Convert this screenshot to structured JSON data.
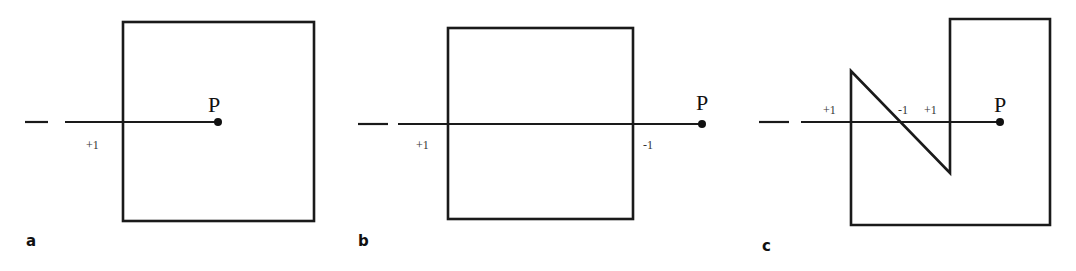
{
  "figure": {
    "hatch_color": "#8a8a8a",
    "stroke_color": "#1a1a1a",
    "panels": [
      {
        "id": "a",
        "panel_label": "a",
        "point_label": "P",
        "crossings": [
          "+1"
        ],
        "shape": "square",
        "point_inside": true
      },
      {
        "id": "b",
        "panel_label": "b",
        "point_label": "P",
        "crossings": [
          "+1",
          "-1"
        ],
        "shape": "square",
        "point_inside": false
      },
      {
        "id": "c",
        "panel_label": "c",
        "point_label": "P",
        "crossings": [
          "+1",
          "-1",
          "+1"
        ],
        "shape": "concave polygon",
        "point_inside": true
      }
    ]
  }
}
